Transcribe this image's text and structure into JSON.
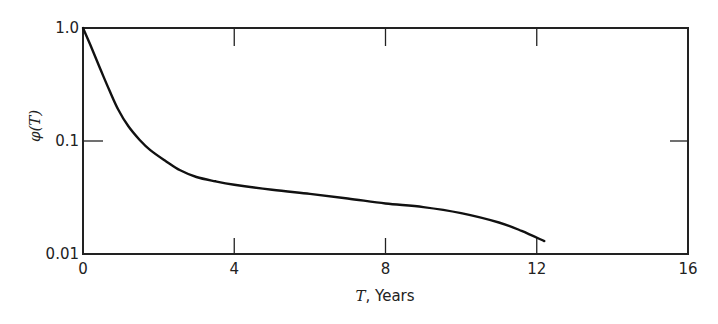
{
  "chart_data": {
    "type": "line",
    "title": "",
    "xlabel_var": "T",
    "xlabel_rest": ", Years",
    "xlabel": "T, Years",
    "ylabel": "φ(T)",
    "ylabel_phi": "φ",
    "ylabel_arg": "(T)",
    "yscale": "log",
    "xlim": [
      0,
      16
    ],
    "ylim": [
      0.01,
      1.0
    ],
    "x_ticks": [
      {
        "value": 0,
        "label": "0"
      },
      {
        "value": 4,
        "label": "4"
      },
      {
        "value": 8,
        "label": "8"
      },
      {
        "value": 12,
        "label": "12"
      },
      {
        "value": 16,
        "label": "16"
      }
    ],
    "y_ticks": [
      {
        "value": 0.01,
        "label": "0.01"
      },
      {
        "value": 0.1,
        "label": "0.1"
      },
      {
        "value": 1.0,
        "label": "1.0"
      }
    ],
    "grid": false,
    "legend": null,
    "series": [
      {
        "name": "φ(T)",
        "x": [
          0,
          0.2,
          0.45,
          0.7,
          0.93,
          1.2,
          1.5,
          1.78,
          2.2,
          2.57,
          3.0,
          3.5,
          4.0,
          5.0,
          6.0,
          7.0,
          8.0,
          9.0,
          10.0,
          11.0,
          11.6,
          12.2
        ],
        "y": [
          1.0,
          0.72,
          0.44,
          0.27,
          0.1,
          0.13,
          0.1,
          0.083,
          0.066,
          0.054,
          0.048,
          0.044,
          0.041,
          0.037,
          0.034,
          0.031,
          0.028,
          0.026,
          0.023,
          0.019,
          0.016,
          0.013
        ]
      }
    ]
  }
}
